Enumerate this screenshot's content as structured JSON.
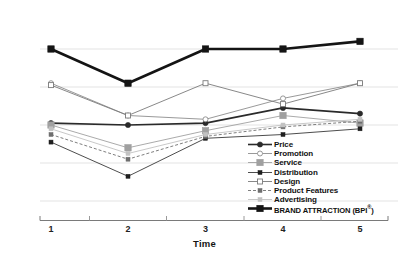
{
  "chart_data": {
    "type": "line",
    "title": "",
    "xlabel": "Time",
    "ylabel": "",
    "categories": [
      "1",
      "2",
      "3",
      "4",
      "5"
    ],
    "x": [
      1,
      2,
      3,
      4,
      5
    ],
    "ylim": [
      0,
      100
    ],
    "grid": true,
    "grid_lines": [
      90,
      70,
      50,
      30,
      10
    ],
    "legend_position": "bottom-right",
    "series": [
      {
        "name": "Price",
        "values": [
          51,
          50,
          51,
          59,
          56
        ],
        "color": "#2a2a2a",
        "marker": "filled-circle",
        "line": "solid",
        "width": 1.6
      },
      {
        "name": "Promotion",
        "values": [
          72,
          55,
          53,
          64,
          72
        ],
        "color": "#8d8d8d",
        "marker": "open-circle",
        "line": "solid",
        "width": 0.9
      },
      {
        "name": "Service",
        "values": [
          50,
          38,
          47,
          55,
          51
        ],
        "color": "#a0a0a0",
        "marker": "filled-square",
        "line": "solid",
        "width": 0.9
      },
      {
        "name": "Distribution",
        "values": [
          41,
          23,
          43,
          45,
          48
        ],
        "color": "#1f1f1f",
        "marker": "small-filled-square",
        "line": "solid",
        "width": 0.8
      },
      {
        "name": "Design",
        "values": [
          71,
          55,
          72,
          61,
          72
        ],
        "color": "#7b7b7b",
        "marker": "open-square",
        "line": "solid",
        "width": 0.9
      },
      {
        "name": "Product Features",
        "values": [
          45,
          32,
          44,
          49,
          52
        ],
        "color": "#6f6f6f",
        "marker": "small-filled-square",
        "line": "dashed",
        "width": 0.9
      },
      {
        "name": "Advertising",
        "values": [
          48,
          35,
          45,
          50,
          53
        ],
        "color": "#c2c2c2",
        "marker": "small-filled-square",
        "line": "solid",
        "width": 0.9
      },
      {
        "name": "BRAND ATTRACTION (BPI®)",
        "values": [
          90,
          72,
          90,
          90,
          94
        ],
        "color": "#141414",
        "marker": "filled-square",
        "line": "solid",
        "width": 2.6
      }
    ]
  },
  "axis": {
    "x_title": "Time",
    "tick_labels": [
      "1",
      "2",
      "3",
      "4",
      "5"
    ]
  },
  "legend": {
    "items": [
      {
        "label": "Price"
      },
      {
        "label": "Promotion"
      },
      {
        "label": "Service"
      },
      {
        "label": "Distribution"
      },
      {
        "label": "Design"
      },
      {
        "label": "Product Features"
      },
      {
        "label": "Advertising"
      },
      {
        "label": "BRAND ATTRACTION (BPI",
        "sup": "®",
        "tail": ")"
      }
    ]
  }
}
